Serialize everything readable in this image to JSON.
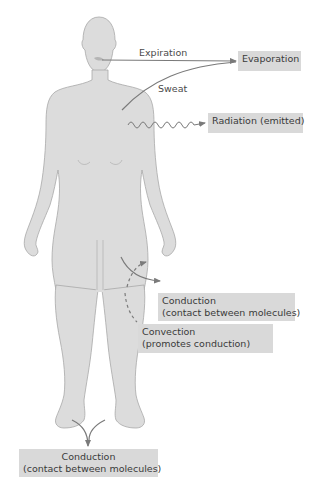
{
  "diagram": {
    "colors": {
      "body_fill": "#dcdcdc",
      "body_outline": "#a8a8a8",
      "label_box": "#d9d9d9",
      "arrow": "#7a7a7a",
      "text": "#3a3a3a"
    },
    "arrow_labels": {
      "expiration": "Expiration",
      "sweat": "Sweat"
    },
    "boxes": {
      "evaporation": "Evaporation",
      "radiation": "Radiation (emitted)",
      "conduction_leg_line1": "Conduction",
      "conduction_leg_line2": "(contact between molecules)",
      "convection_line1": "Convection",
      "convection_line2": "(promotes conduction)",
      "conduction_feet_line1": "Conduction",
      "conduction_feet_line2": "(contact between molecules)"
    }
  }
}
